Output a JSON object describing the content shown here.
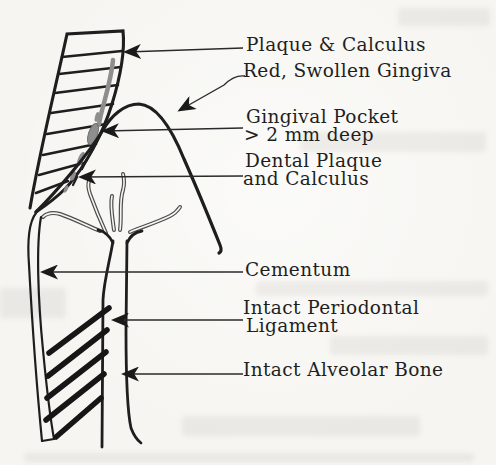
{
  "figure": {
    "type": "labeled-diagram",
    "colors": {
      "background": "#f6f5f1",
      "line": "#1e1e1e",
      "leader": "#2a2a2a",
      "plaque_deposit": "#8e8e8e",
      "vessel": "#4d4d4d",
      "text": "#1f1f1f"
    },
    "labels": {
      "plaque_calculus": "Plaque & Calculus",
      "red_swollen_gingiva": "Red, Swollen Gingiva",
      "gingival_pocket_line1": "Gingival Pocket",
      "gingival_pocket_line2": "> 2 mm deep",
      "dental_plaque_line1": "Dental Plaque",
      "dental_plaque_line2": "and Calculus",
      "cementum": "Cementum",
      "periodontal_ligament_line1": "Intact Periodontal",
      "periodontal_ligament_line2": "Ligament",
      "alveolar_bone": "Intact Alveolar Bone"
    }
  }
}
